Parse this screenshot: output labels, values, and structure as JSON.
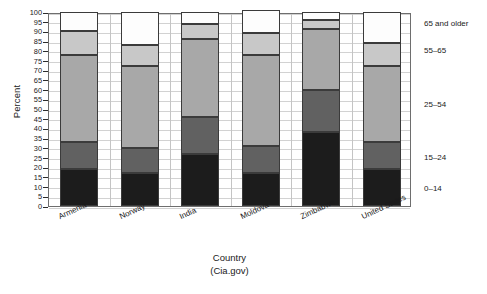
{
  "chart_data": {
    "type": "bar",
    "subtype": "stacked-bar-100",
    "title": "",
    "xlabel": "Country",
    "xlabel_sub": "(Cia.gov)",
    "ylabel": "Percent",
    "ylim": [
      0,
      100
    ],
    "ytick_step": 5,
    "yticks": [
      0,
      5,
      10,
      15,
      20,
      25,
      30,
      35,
      40,
      45,
      50,
      55,
      60,
      65,
      70,
      75,
      80,
      85,
      90,
      95,
      100
    ],
    "grid": true,
    "legend_position": "right",
    "categories": [
      "Armenia",
      "Norway",
      "India",
      "Moldova",
      "Zimbabwe",
      "United States"
    ],
    "series": [
      {
        "name": "0–14",
        "color": "#1c1c1c",
        "values": [
          19,
          17,
          27,
          17,
          38,
          19
        ]
      },
      {
        "name": "15–24",
        "color": "#616161",
        "values": [
          14,
          13,
          19,
          14,
          22,
          14
        ]
      },
      {
        "name": "25–54",
        "color": "#a8a8a8",
        "values": [
          45,
          42,
          40,
          47,
          31,
          39
        ]
      },
      {
        "name": "55–65",
        "color": "#c8c8c8",
        "values": [
          12,
          11,
          8,
          11,
          5,
          12
        ]
      },
      {
        "name": "65 and older",
        "color": "#fdfdfd",
        "values": [
          10,
          17,
          6,
          12,
          4,
          16
        ]
      }
    ],
    "cumulative_tops": {
      "Armenia": [
        19,
        33,
        78,
        90,
        100
      ],
      "Norway": [
        17,
        30,
        72,
        83,
        100
      ],
      "India": [
        27,
        46,
        86,
        94,
        100
      ],
      "Moldova": [
        17,
        30,
        77,
        88,
        100
      ],
      "Zimbabwe": [
        38,
        60,
        91,
        96,
        100
      ],
      "United States": [
        19,
        33,
        72,
        84,
        100
      ]
    },
    "legend_entries": [
      {
        "label": "65 and older",
        "y_anchor": 95
      },
      {
        "label": "55–65",
        "y_anchor": 81
      },
      {
        "label": "25–54",
        "y_anchor": 53
      },
      {
        "label": "15–24",
        "y_anchor": 26
      },
      {
        "label": "0–14",
        "y_anchor": 10
      }
    ]
  }
}
